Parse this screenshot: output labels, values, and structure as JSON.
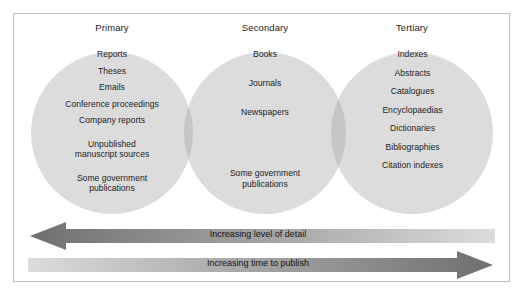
{
  "figure": {
    "type": "venn-diagram"
  },
  "columns": [
    {
      "id": "primary",
      "label": "Primary"
    },
    {
      "id": "secondary",
      "label": "Secondary"
    },
    {
      "id": "tertiary",
      "label": "Tertiary"
    }
  ],
  "sets": {
    "primary": {
      "label": "Primary",
      "items": [
        "Reports",
        "Theses",
        "Emails",
        "Conference proceedings",
        "Company reports",
        "Unpublished",
        "manuscript sources",
        "Some government",
        "publications"
      ]
    },
    "secondary": {
      "label": "Secondary",
      "items": [
        "Books",
        "Journals",
        "Newspapers",
        "Some government",
        "publications"
      ]
    },
    "tertiary": {
      "label": "Tertiary",
      "items": [
        "Indexes",
        "Abstracts",
        "Catalogues",
        "Encyclopaedias",
        "Dictionaries",
        "Bibliographies",
        "Citation indexes"
      ]
    }
  },
  "arrows": [
    {
      "id": "detail",
      "label": "Increasing level of detail",
      "direction": "left",
      "meaning": "detail increases towards Primary sources"
    },
    {
      "id": "publish",
      "label": "Increasing time to publish",
      "direction": "right",
      "meaning": "time to publish increases towards Tertiary sources"
    }
  ],
  "colors": {
    "page_background": "#ffffff",
    "frame_border": "#bdbdbd",
    "circle_fill": "#dcdcdc",
    "circle_overlap_fill": "#c6c6c6",
    "arrow_dark": "#7a7a7a",
    "arrow_light": "#d9d9d9",
    "text": "#1c1c1c"
  }
}
